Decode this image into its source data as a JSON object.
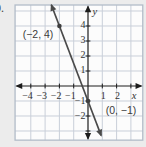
{
  "page": {
    "problem_number_partial": "0."
  },
  "chart_data": {
    "type": "line",
    "points": [
      {
        "x": -2,
        "y": 4,
        "label": "(−2, 4)"
      },
      {
        "x": 0,
        "y": -1,
        "label": "(0, −1)"
      }
    ],
    "line": {
      "through_points": [
        [
          -2,
          4
        ],
        [
          0,
          -1
        ]
      ],
      "y_extent": [
        5.4,
        -3.3
      ],
      "arrows": "both-ends"
    },
    "x_axis": {
      "label": "x",
      "ticks": [
        -4,
        -3,
        -2,
        -1,
        1,
        2
      ],
      "range": [
        -5.1,
        3.83
      ]
    },
    "y_axis": {
      "label": "y",
      "ticks": [
        4,
        3,
        2,
        1,
        -1,
        -2
      ],
      "range": [
        -3.61,
        5.4
      ]
    },
    "grid": {
      "show": true,
      "spacing": 1
    },
    "colors": {
      "page_bg": "#ececec",
      "plot_bg": "#fcfcfc",
      "grid": "#c9cfd9",
      "grid_border": "#b2bcc8",
      "axis": "#1c1c1c",
      "line": "#4a4a4a",
      "point": "#3f3f3f",
      "text": "#333333",
      "point_label_text": "#3a3a3a"
    }
  }
}
